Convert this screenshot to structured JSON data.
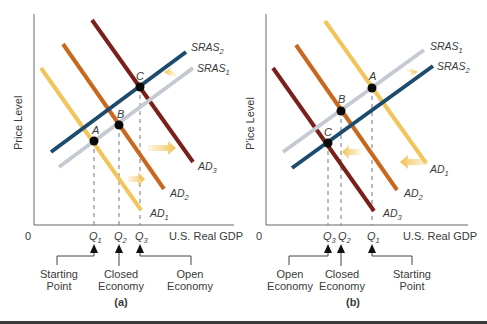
{
  "colors": {
    "ad1": "#f2c55a",
    "ad2": "#c8681e",
    "ad3": "#7a1f1a",
    "sras1": "#c4c9d2",
    "sras2": "#1d4b6e",
    "axis": "#555555",
    "point": "#0a0a0a",
    "shift_arrow": "#f4d27a"
  },
  "panels": [
    {
      "id": "a",
      "label": "(a)",
      "y_axis_label": "Price Level",
      "x_axis_label": "U.S. Real GDP",
      "origin_label": "0",
      "curves": [
        {
          "name": "SRAS",
          "sub": "2"
        },
        {
          "name": "SRAS",
          "sub": "1"
        },
        {
          "name": "AD",
          "sub": "3"
        },
        {
          "name": "AD",
          "sub": "2"
        },
        {
          "name": "AD",
          "sub": "1"
        }
      ],
      "points": [
        "A",
        "B",
        "C"
      ],
      "q_ticks": [
        {
          "name": "Q",
          "sub": "1"
        },
        {
          "name": "Q",
          "sub": "2"
        },
        {
          "name": "Q",
          "sub": "3"
        }
      ],
      "callouts": [
        {
          "line1": "Starting",
          "line2": "Point"
        },
        {
          "line1": "Closed",
          "line2": "Economy"
        },
        {
          "line1": "Open",
          "line2": "Economy"
        }
      ]
    },
    {
      "id": "b",
      "label": "(b)",
      "y_axis_label": "P'ice Level",
      "x_axis_label": "U.S. Real GDP",
      "origin_label": "0",
      "curves": [
        {
          "name": "SRAS",
          "sub": "1"
        },
        {
          "name": "SRAS",
          "sub": "2"
        },
        {
          "name": "AD",
          "sub": "1"
        },
        {
          "name": "AD",
          "sub": "2"
        },
        {
          "name": "AD",
          "sub": "3"
        }
      ],
      "points": [
        "A",
        "B",
        "C"
      ],
      "q_ticks": [
        {
          "name": "Q",
          "sub": "3"
        },
        {
          "name": "Q",
          "sub": "2"
        },
        {
          "name": "Q",
          "sub": "1"
        }
      ],
      "callouts": [
        {
          "line1": "Open",
          "line2": "Economy"
        },
        {
          "line1": "Closed",
          "line2": "Economy"
        },
        {
          "line1": "Starting",
          "line2": "Point"
        }
      ]
    }
  ]
}
